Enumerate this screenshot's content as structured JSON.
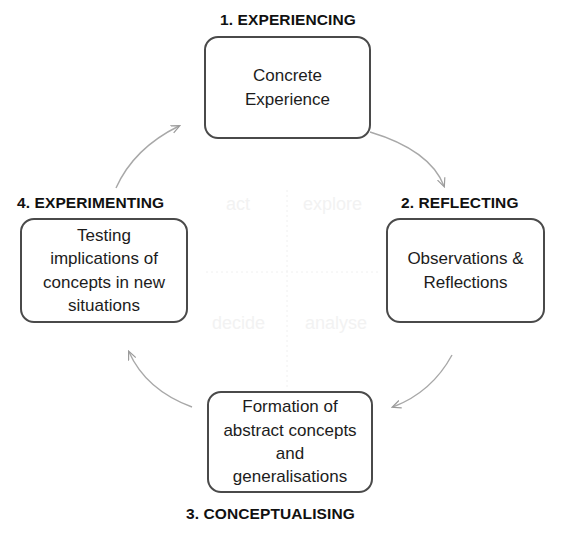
{
  "diagram": {
    "background_color": "#ffffff",
    "box_border_color": "#4a4a4a",
    "arrow_color": "#9a9a9a",
    "ghost_text_color": "#f2f2f2"
  },
  "stages": [
    {
      "id": "experiencing",
      "label": "1. EXPERIENCING",
      "text": "Concrete\nExperience",
      "position": "top"
    },
    {
      "id": "reflecting",
      "label": "2. REFLECTING",
      "text": "Observations &\nReflections",
      "position": "right"
    },
    {
      "id": "conceptualising",
      "label": "3. CONCEPTUALISING",
      "text": "Formation of\nabstract concepts\nand\ngeneralisations",
      "position": "bottom"
    },
    {
      "id": "experimenting",
      "label": "4. EXPERIMENTING",
      "text": "Testing\nimplications of\nconcepts in new\nsituations",
      "position": "left"
    }
  ],
  "centre_words": {
    "top_left": "act",
    "top_right": "explore",
    "bottom_left": "decide",
    "bottom_right": "analyse"
  },
  "arrows": [
    {
      "id": "arrow-1-to-2",
      "from": "experiencing",
      "to": "reflecting"
    },
    {
      "id": "arrow-2-to-3",
      "from": "reflecting",
      "to": "conceptualising"
    },
    {
      "id": "arrow-3-to-4",
      "from": "conceptualising",
      "to": "experimenting"
    },
    {
      "id": "arrow-4-to-1",
      "from": "experimenting",
      "to": "experiencing"
    }
  ]
}
